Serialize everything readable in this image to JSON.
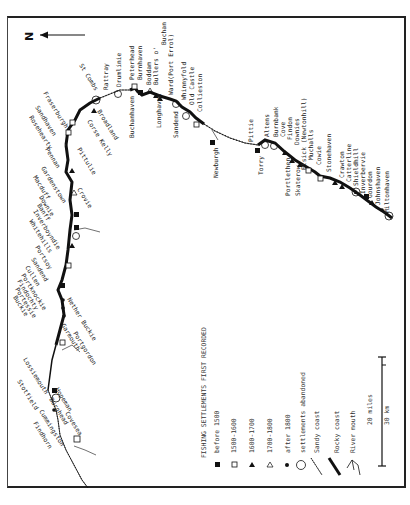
{
  "north_label": "N",
  "legend": {
    "title": "FISHING SETTLEMENTS FIRST RECORDED",
    "items": [
      {
        "symbol": "filled-square",
        "label": "before 1500"
      },
      {
        "symbol": "open-square",
        "label": "1500-1600"
      },
      {
        "symbol": "filled-triangle",
        "label": "1600-1700"
      },
      {
        "symbol": "open-triangle",
        "label": "1700-1800"
      },
      {
        "symbol": "filled-dot",
        "label": "after 1800"
      },
      {
        "symbol": "open-circle",
        "label": "settlements abandoned"
      },
      {
        "symbol": "sandy-coast",
        "label": "Sandy coast"
      },
      {
        "symbol": "rocky-coast",
        "label": "Rocky coast"
      },
      {
        "symbol": "river-mouth",
        "label": "River mouth"
      }
    ]
  },
  "scale": {
    "miles_label": "20 miles",
    "km_label": "30 km"
  },
  "east_coast_places": [
    "Drumlinie",
    "Peterhead",
    "Burnhaven",
    "Boddam",
    "Bullers o'",
    "Buchan",
    "Ward(Port Errol)",
    "Whinnyfold",
    "Old Castle",
    "Collieston",
    "Pittie",
    "Altens",
    "Burnbank",
    "Cove",
    "Findon",
    "Downies",
    "Elsick (Newtonhill)",
    "Muchalls",
    "Cowie",
    "Stonehaven",
    "Crawton",
    "Catterline",
    "Shieldhill",
    "Inverbervie",
    "Gourdon",
    "Johnshaven",
    "Miltonhaven"
  ],
  "east_coast_places_lower": [
    "Buchanhaven",
    "Longhaven",
    "Sandend",
    "Newburgh",
    "Torry",
    "Portlethen",
    "Skaterow"
  ],
  "north_coast_places": [
    "St Combs",
    "Rattray",
    "Broadland",
    "Corse Kelly",
    "Fraserburgh",
    "Sandhaven",
    "Rosehearty",
    "Pennan",
    "Pittulie",
    "Crovie",
    "Gardenstown",
    "Macduff",
    "Downie",
    "Banff",
    "Inverboyndie",
    "Whitehills",
    "Portsoy",
    "Sandend",
    "Cullen",
    "Portknockie",
    "Findochty",
    "Portessie",
    "Buckie",
    "Portgordon",
    "Nether Buckie",
    "Garmouth",
    "Lossiemouth",
    "Stotfield",
    "Hopeman",
    "Burghead",
    "Covesea",
    "Cummingston",
    "Findhorn"
  ]
}
